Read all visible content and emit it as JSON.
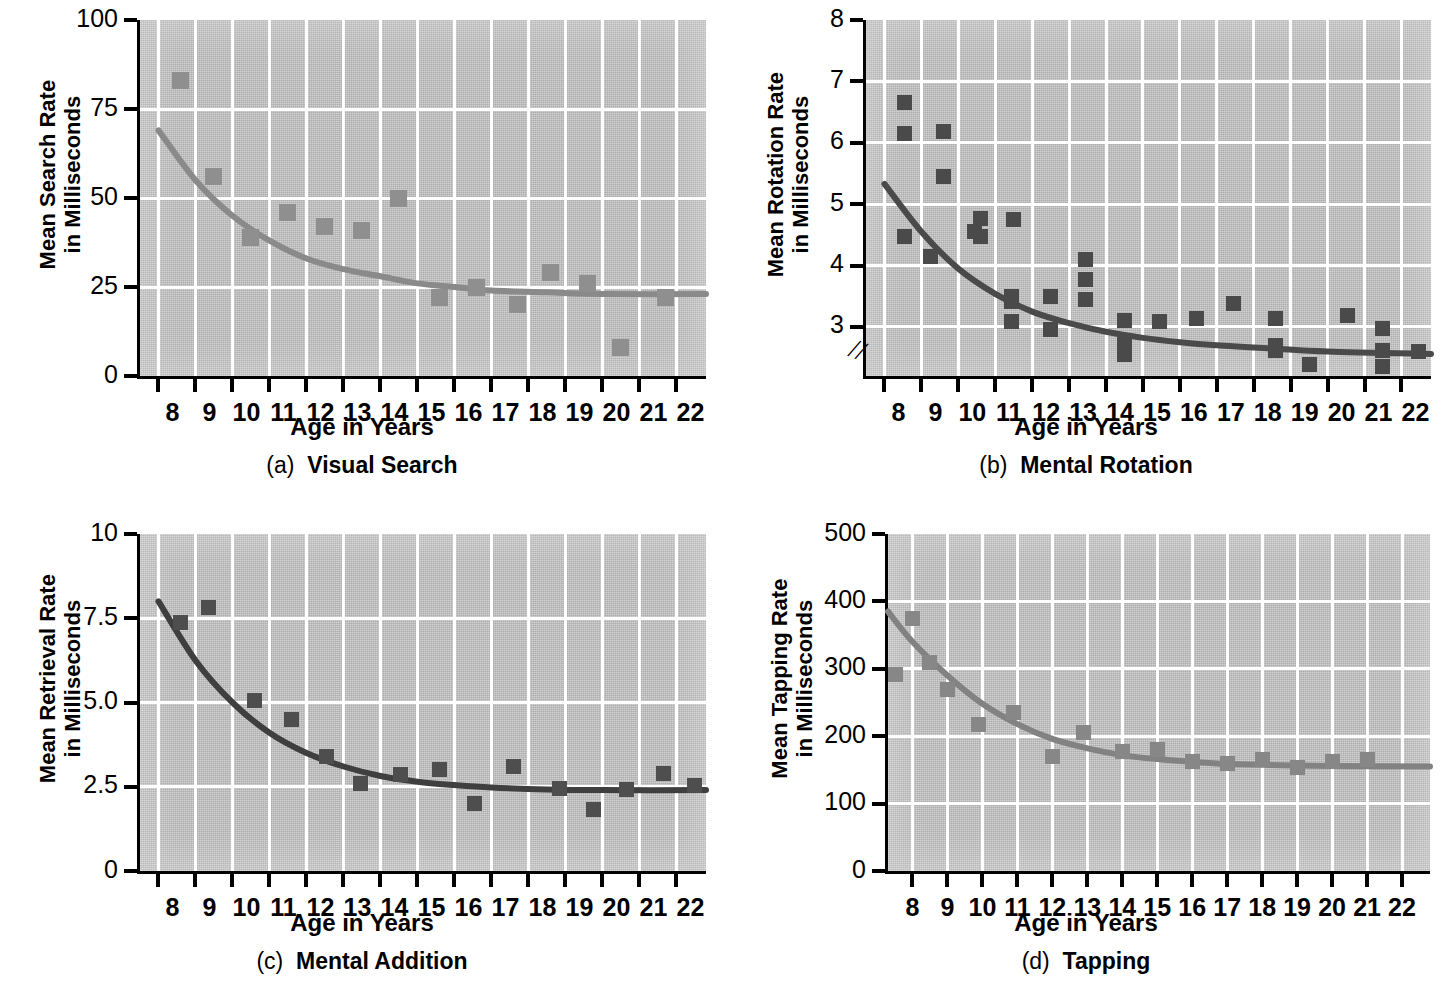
{
  "figure": {
    "x_title": "Age in Years",
    "panels": [
      "a",
      "b",
      "c",
      "d"
    ]
  },
  "panel_a": {
    "caption_label": "(a)",
    "caption_text": "Visual Search",
    "y_title": "Mean Search Rate\nin Milliseconds",
    "x_title": "Age in Years",
    "y_ticks": [
      "100",
      "75",
      "50",
      "25",
      "0"
    ],
    "x_ticks": [
      "8",
      "9",
      "10",
      "11",
      "12",
      "13",
      "14",
      "15",
      "16",
      "17",
      "18",
      "19",
      "20",
      "21",
      "22"
    ],
    "marker_color": "#8f8f8f",
    "curve_color": "#8a8a8a"
  },
  "panel_b": {
    "caption_label": "(b)",
    "caption_text": "Mental Rotation",
    "y_title": "Mean Rotation Rate\nin Milliseconds",
    "x_title": "Age in Years",
    "y_ticks": [
      "8",
      "7",
      "6",
      "5",
      "4",
      "3"
    ],
    "x_ticks": [
      "8",
      "9",
      "10",
      "11",
      "12",
      "13",
      "14",
      "15",
      "16",
      "17",
      "18",
      "19",
      "20",
      "21",
      "22"
    ],
    "axis_break": "//",
    "marker_color": "#4a4a4a",
    "curve_color": "#4a4a4a"
  },
  "panel_c": {
    "caption_label": "(c)",
    "caption_text": "Mental Addition",
    "y_title": "Mean Retrieval Rate\nin Milliseconds",
    "x_title": "Age in Years",
    "y_ticks": [
      "10",
      "7.5",
      "5.0",
      "2.5",
      "0"
    ],
    "x_ticks": [
      "8",
      "9",
      "10",
      "11",
      "12",
      "13",
      "14",
      "15",
      "16",
      "17",
      "18",
      "19",
      "20",
      "21",
      "22"
    ],
    "marker_color": "#4e4e4e",
    "curve_color": "#3f3f3f"
  },
  "panel_d": {
    "caption_label": "(d)",
    "caption_text": "Tapping",
    "y_title": "Mean Tapping Rate\nin Milliseconds",
    "x_title": "Age in Years",
    "y_ticks": [
      "500",
      "400",
      "300",
      "200",
      "100",
      "0"
    ],
    "x_ticks": [
      "8",
      "9",
      "10",
      "11",
      "12",
      "13",
      "14",
      "15",
      "16",
      "17",
      "18",
      "19",
      "20",
      "21",
      "22"
    ],
    "marker_color": "#878787",
    "curve_color": "#828282"
  },
  "chart_data": [
    {
      "type": "scatter",
      "id": "a",
      "title": "(a) Visual Search",
      "xlabel": "Age in Years",
      "ylabel": "Mean Search Rate in Milliseconds",
      "xlim": [
        7.5,
        22.8
      ],
      "ylim": [
        0,
        100
      ],
      "yticks": [
        0,
        25,
        50,
        75,
        100
      ],
      "xticks": [
        8,
        9,
        10,
        11,
        12,
        13,
        14,
        15,
        16,
        17,
        18,
        19,
        20,
        21,
        22
      ],
      "grid": true,
      "legend": "none",
      "points": [
        {
          "x": 8.6,
          "y": 83
        },
        {
          "x": 9.5,
          "y": 56
        },
        {
          "x": 10.5,
          "y": 39
        },
        {
          "x": 11.5,
          "y": 46
        },
        {
          "x": 12.5,
          "y": 42
        },
        {
          "x": 13.5,
          "y": 41
        },
        {
          "x": 14.5,
          "y": 50
        },
        {
          "x": 15.6,
          "y": 22
        },
        {
          "x": 16.6,
          "y": 25
        },
        {
          "x": 17.7,
          "y": 20
        },
        {
          "x": 18.6,
          "y": 29
        },
        {
          "x": 19.6,
          "y": 26
        },
        {
          "x": 20.5,
          "y": 8
        },
        {
          "x": 21.7,
          "y": 22
        }
      ],
      "fit_curve": {
        "description": "decreasing exponential fit",
        "points": [
          {
            "x": 8.0,
            "y": 69
          },
          {
            "x": 9.0,
            "y": 55
          },
          {
            "x": 10.0,
            "y": 45
          },
          {
            "x": 11.0,
            "y": 38
          },
          {
            "x": 12.0,
            "y": 33
          },
          {
            "x": 13.0,
            "y": 30
          },
          {
            "x": 14.0,
            "y": 28
          },
          {
            "x": 15.0,
            "y": 26
          },
          {
            "x": 16.0,
            "y": 25
          },
          {
            "x": 17.0,
            "y": 24
          },
          {
            "x": 18.5,
            "y": 23.5
          },
          {
            "x": 20.0,
            "y": 23
          },
          {
            "x": 22.8,
            "y": 23
          }
        ]
      }
    },
    {
      "type": "scatter",
      "id": "b",
      "title": "(b) Mental Rotation",
      "xlabel": "Age in Years",
      "ylabel": "Mean Rotation Rate in Milliseconds",
      "xlim": [
        7.5,
        22.8
      ],
      "ylim": [
        2.2,
        8
      ],
      "yticks": [
        3,
        4,
        5,
        6,
        7,
        8
      ],
      "xticks": [
        8,
        9,
        10,
        11,
        12,
        13,
        14,
        15,
        16,
        17,
        18,
        19,
        20,
        21,
        22
      ],
      "grid": true,
      "axis_break": true,
      "legend": "none",
      "points": [
        {
          "x": 8.55,
          "y": 6.65
        },
        {
          "x": 8.55,
          "y": 6.15
        },
        {
          "x": 8.55,
          "y": 4.48
        },
        {
          "x": 9.25,
          "y": 4.15
        },
        {
          "x": 9.6,
          "y": 6.18
        },
        {
          "x": 9.6,
          "y": 5.45
        },
        {
          "x": 10.45,
          "y": 4.55
        },
        {
          "x": 10.6,
          "y": 4.77
        },
        {
          "x": 10.6,
          "y": 4.48
        },
        {
          "x": 11.5,
          "y": 4.75
        },
        {
          "x": 11.45,
          "y": 3.5
        },
        {
          "x": 11.45,
          "y": 3.08
        },
        {
          "x": 11.45,
          "y": 3.42
        },
        {
          "x": 12.5,
          "y": 3.5
        },
        {
          "x": 12.5,
          "y": 2.95
        },
        {
          "x": 13.45,
          "y": 4.1
        },
        {
          "x": 13.45,
          "y": 3.78
        },
        {
          "x": 13.45,
          "y": 3.44
        },
        {
          "x": 14.5,
          "y": 3.1
        },
        {
          "x": 14.5,
          "y": 2.72
        },
        {
          "x": 14.5,
          "y": 2.55
        },
        {
          "x": 15.45,
          "y": 3.09
        },
        {
          "x": 16.45,
          "y": 3.13
        },
        {
          "x": 17.45,
          "y": 3.38
        },
        {
          "x": 18.6,
          "y": 3.13
        },
        {
          "x": 18.6,
          "y": 2.7
        },
        {
          "x": 18.6,
          "y": 2.62
        },
        {
          "x": 19.5,
          "y": 2.38
        },
        {
          "x": 20.55,
          "y": 3.18
        },
        {
          "x": 21.5,
          "y": 2.98
        },
        {
          "x": 21.5,
          "y": 2.62
        },
        {
          "x": 21.5,
          "y": 2.35
        },
        {
          "x": 22.45,
          "y": 2.6
        }
      ],
      "fit_curve": {
        "description": "decreasing exponential fit",
        "points": [
          {
            "x": 8.0,
            "y": 5.33
          },
          {
            "x": 9.0,
            "y": 4.55
          },
          {
            "x": 10.0,
            "y": 3.95
          },
          {
            "x": 11.0,
            "y": 3.54
          },
          {
            "x": 12.0,
            "y": 3.25
          },
          {
            "x": 13.0,
            "y": 3.06
          },
          {
            "x": 14.0,
            "y": 2.92
          },
          {
            "x": 15.0,
            "y": 2.82
          },
          {
            "x": 16.0,
            "y": 2.75
          },
          {
            "x": 17.0,
            "y": 2.7
          },
          {
            "x": 18.5,
            "y": 2.65
          },
          {
            "x": 20.0,
            "y": 2.6
          },
          {
            "x": 22.8,
            "y": 2.56
          }
        ]
      }
    },
    {
      "type": "scatter",
      "id": "c",
      "title": "(c) Mental Addition",
      "xlabel": "Age in Years",
      "ylabel": "Mean Retrieval Rate in Milliseconds",
      "xlim": [
        7.5,
        22.8
      ],
      "ylim": [
        0,
        10
      ],
      "yticks": [
        0,
        2.5,
        5.0,
        7.5,
        10
      ],
      "xticks": [
        8,
        9,
        10,
        11,
        12,
        13,
        14,
        15,
        16,
        17,
        18,
        19,
        20,
        21,
        22
      ],
      "grid": true,
      "legend": "none",
      "points": [
        {
          "x": 8.6,
          "y": 7.38
        },
        {
          "x": 9.35,
          "y": 7.82
        },
        {
          "x": 10.6,
          "y": 5.05
        },
        {
          "x": 11.6,
          "y": 4.5
        },
        {
          "x": 12.55,
          "y": 3.4
        },
        {
          "x": 13.45,
          "y": 2.6
        },
        {
          "x": 14.55,
          "y": 2.85
        },
        {
          "x": 15.6,
          "y": 3.0
        },
        {
          "x": 16.55,
          "y": 2.0
        },
        {
          "x": 17.6,
          "y": 3.1
        },
        {
          "x": 18.85,
          "y": 2.45
        },
        {
          "x": 19.75,
          "y": 1.82
        },
        {
          "x": 20.65,
          "y": 2.42
        },
        {
          "x": 21.65,
          "y": 2.9
        },
        {
          "x": 22.5,
          "y": 2.55
        }
      ],
      "fit_curve": {
        "description": "decreasing exponential fit",
        "points": [
          {
            "x": 8.0,
            "y": 8.0
          },
          {
            "x": 9.0,
            "y": 6.25
          },
          {
            "x": 10.0,
            "y": 5.0
          },
          {
            "x": 11.0,
            "y": 4.1
          },
          {
            "x": 12.0,
            "y": 3.5
          },
          {
            "x": 13.0,
            "y": 3.1
          },
          {
            "x": 14.0,
            "y": 2.82
          },
          {
            "x": 15.0,
            "y": 2.65
          },
          {
            "x": 16.0,
            "y": 2.55
          },
          {
            "x": 17.0,
            "y": 2.48
          },
          {
            "x": 18.5,
            "y": 2.42
          },
          {
            "x": 20.0,
            "y": 2.4
          },
          {
            "x": 22.8,
            "y": 2.4
          }
        ]
      }
    },
    {
      "type": "scatter",
      "id": "d",
      "title": "(d) Tapping",
      "xlabel": "Age in Years",
      "ylabel": "Mean Tapping Rate in Milliseconds",
      "xlim": [
        7.3,
        22.8
      ],
      "ylim": [
        0,
        500
      ],
      "yticks": [
        0,
        100,
        200,
        300,
        400,
        500
      ],
      "xticks": [
        8,
        9,
        10,
        11,
        12,
        13,
        14,
        15,
        16,
        17,
        18,
        19,
        20,
        21,
        22
      ],
      "grid": true,
      "legend": "none",
      "points": [
        {
          "x": 7.5,
          "y": 292
        },
        {
          "x": 8.0,
          "y": 375
        },
        {
          "x": 8.5,
          "y": 310
        },
        {
          "x": 9.0,
          "y": 270
        },
        {
          "x": 9.9,
          "y": 218
        },
        {
          "x": 10.9,
          "y": 235
        },
        {
          "x": 12.0,
          "y": 170
        },
        {
          "x": 12.9,
          "y": 205
        },
        {
          "x": 14.0,
          "y": 177
        },
        {
          "x": 15.0,
          "y": 180
        },
        {
          "x": 16.0,
          "y": 162
        },
        {
          "x": 17.0,
          "y": 160
        },
        {
          "x": 18.0,
          "y": 165
        },
        {
          "x": 19.0,
          "y": 153
        },
        {
          "x": 20.0,
          "y": 163
        },
        {
          "x": 21.0,
          "y": 165
        }
      ],
      "fit_curve": {
        "description": "decreasing exponential fit",
        "points": [
          {
            "x": 7.3,
            "y": 385
          },
          {
            "x": 8.0,
            "y": 340
          },
          {
            "x": 9.0,
            "y": 290
          },
          {
            "x": 10.0,
            "y": 248
          },
          {
            "x": 11.0,
            "y": 218
          },
          {
            "x": 12.0,
            "y": 196
          },
          {
            "x": 13.0,
            "y": 182
          },
          {
            "x": 14.0,
            "y": 172
          },
          {
            "x": 15.0,
            "y": 166
          },
          {
            "x": 16.0,
            "y": 162
          },
          {
            "x": 17.0,
            "y": 159
          },
          {
            "x": 18.5,
            "y": 157
          },
          {
            "x": 20.0,
            "y": 156
          },
          {
            "x": 22.8,
            "y": 155
          }
        ]
      }
    }
  ]
}
